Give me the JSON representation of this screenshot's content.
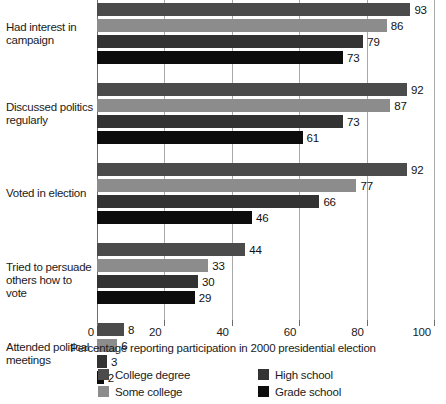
{
  "chart_data": {
    "type": "bar",
    "orientation": "horizontal",
    "title": "",
    "xlabel": "Percentage reporting participation in 2000 presidential election",
    "ylabel": "",
    "xlim": [
      0,
      100
    ],
    "xticks": [
      0,
      20,
      40,
      60,
      80,
      100
    ],
    "grid": true,
    "legend_position": "bottom",
    "categories": [
      "Had interest in campaign",
      "Discussed politics regularly",
      "Voted in election",
      "Tried to persuade others how to vote",
      "Attended political meetings"
    ],
    "series": [
      {
        "name": "College degree",
        "color": "#4b4b4b",
        "values": [
          93,
          92,
          92,
          44,
          8
        ]
      },
      {
        "name": "Some college",
        "color": "#8c8c8c",
        "values": [
          86,
          87,
          77,
          33,
          6
        ]
      },
      {
        "name": "High school",
        "color": "#333333",
        "values": [
          79,
          73,
          66,
          30,
          3
        ]
      },
      {
        "name": "Grade school",
        "color": "#0d0d0d",
        "values": [
          73,
          61,
          46,
          29,
          2
        ]
      }
    ]
  },
  "axis": {
    "tick_labels": [
      "0",
      "20",
      "40",
      "60",
      "80",
      "100"
    ],
    "title": "Percentage reporting participation in 2000 presidential election"
  },
  "category_labels": [
    "Had interest in campaign",
    "Discussed politics regularly",
    "Voted in election",
    "Tried to persuade others how to vote",
    "Attended political meetings"
  ],
  "legend": {
    "items": [
      {
        "label": "College degree",
        "color": "#4b4b4b"
      },
      {
        "label": "High school",
        "color": "#333333"
      },
      {
        "label": "Some college",
        "color": "#8c8c8c"
      },
      {
        "label": "Grade school",
        "color": "#0d0d0d"
      }
    ]
  },
  "colors": {
    "gridline": "#a8a8a8",
    "axis": "#6e6e6e",
    "text": "#1b1b1b",
    "background": "#ffffff"
  }
}
